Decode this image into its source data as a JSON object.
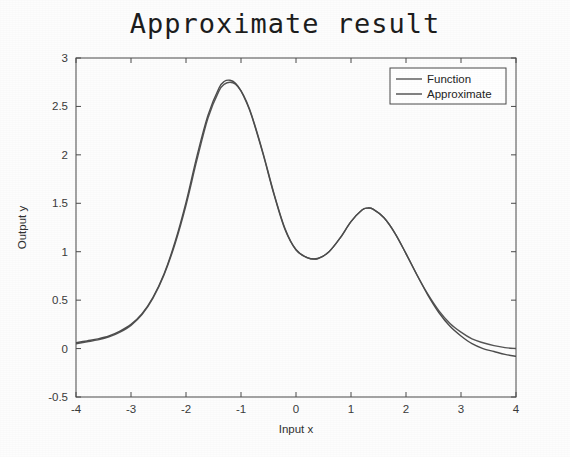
{
  "figure": {
    "title": "Approximate result",
    "background": "#fdfdfd",
    "axes_color": "#4a4a4a"
  },
  "chart_data": {
    "type": "line",
    "title": "Approximate result",
    "xlabel": "Input x",
    "ylabel": "Output y",
    "xlim": [
      -4,
      4
    ],
    "ylim": [
      -0.5,
      3
    ],
    "xticks": [
      -4,
      -3,
      -2,
      -1,
      0,
      1,
      2,
      3,
      4
    ],
    "xticklabels": [
      "-4",
      "-3",
      "-2",
      "-1",
      "0",
      "1",
      "2",
      "3",
      "4"
    ],
    "yticks": [
      -0.5,
      0,
      0.5,
      1,
      1.5,
      2,
      2.5,
      3
    ],
    "yticklabels": [
      "-0.5",
      "0",
      "0.5",
      "1",
      "1.5",
      "2",
      "2.5",
      "3"
    ],
    "grid": false,
    "legend_position": "top-right",
    "x": [
      -4.0,
      -3.8,
      -3.6,
      -3.4,
      -3.2,
      -3.0,
      -2.8,
      -2.6,
      -2.4,
      -2.2,
      -2.0,
      -1.8,
      -1.6,
      -1.4,
      -1.3,
      -1.2,
      -1.1,
      -1.0,
      -0.9,
      -0.8,
      -0.6,
      -0.4,
      -0.2,
      0.0,
      0.2,
      0.4,
      0.6,
      0.8,
      1.0,
      1.2,
      1.3,
      1.4,
      1.6,
      1.8,
      2.0,
      2.2,
      2.4,
      2.6,
      2.8,
      3.0,
      3.2,
      3.4,
      3.6,
      3.8,
      4.0
    ],
    "series": [
      {
        "name": "Function",
        "color": "#555555",
        "width": 1.4,
        "values": [
          0.05,
          0.07,
          0.09,
          0.12,
          0.17,
          0.24,
          0.35,
          0.52,
          0.76,
          1.08,
          1.48,
          1.95,
          2.38,
          2.66,
          2.73,
          2.75,
          2.73,
          2.66,
          2.55,
          2.4,
          2.02,
          1.6,
          1.24,
          1.02,
          0.94,
          0.93,
          1.0,
          1.14,
          1.31,
          1.43,
          1.45,
          1.44,
          1.35,
          1.19,
          0.98,
          0.76,
          0.56,
          0.39,
          0.26,
          0.17,
          0.1,
          0.06,
          0.03,
          0.01,
          0.0
        ]
      },
      {
        "name": "Approximate",
        "color": "#4d4d4d",
        "width": 1.4,
        "values": [
          0.06,
          0.08,
          0.1,
          0.13,
          0.18,
          0.25,
          0.36,
          0.53,
          0.77,
          1.1,
          1.51,
          1.99,
          2.41,
          2.69,
          2.76,
          2.77,
          2.74,
          2.66,
          2.54,
          2.39,
          2.01,
          1.59,
          1.23,
          1.02,
          0.94,
          0.93,
          1.0,
          1.14,
          1.31,
          1.43,
          1.45,
          1.44,
          1.35,
          1.19,
          0.98,
          0.76,
          0.55,
          0.37,
          0.23,
          0.13,
          0.05,
          0.0,
          -0.03,
          -0.06,
          -0.08
        ]
      }
    ],
    "annotations": []
  },
  "legend": {
    "entries": [
      {
        "label": "Function"
      },
      {
        "label": "Approximate"
      }
    ]
  }
}
